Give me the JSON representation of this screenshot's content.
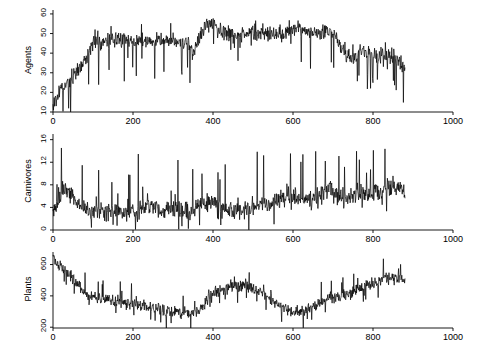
{
  "figure": {
    "background": "#ffffff",
    "foreground": "#000000",
    "panel_count": 3
  },
  "chart_data": [
    {
      "type": "line",
      "title": "",
      "xlabel": "",
      "ylabel": "Agents",
      "xlim": [
        0,
        1000
      ],
      "ylim": [
        10,
        62
      ],
      "xticks": [
        0,
        200,
        400,
        600,
        800,
        1000
      ],
      "yticks": [
        10,
        20,
        30,
        40,
        50,
        60
      ],
      "xtick_labels": [
        "0",
        "200",
        "400",
        "600",
        "800",
        "1000"
      ],
      "ytick_labels": [
        "10",
        "20",
        "30",
        "40",
        "50",
        "60"
      ],
      "grid": false,
      "legend": "none",
      "series": [
        {
          "name": "Agents",
          "x_start": 0,
          "x_end": 880,
          "n_points": 880,
          "seed": 17,
          "baseline_x": [
            0,
            20,
            45,
            70,
            100,
            140,
            180,
            210,
            230,
            250,
            265,
            280,
            300,
            320,
            340,
            350,
            360,
            375,
            390,
            410,
            430,
            450,
            470,
            490,
            510,
            530,
            550,
            570,
            590,
            610,
            630,
            650,
            670,
            690,
            700,
            715,
            730,
            750,
            770,
            790,
            810,
            830,
            850,
            865,
            880
          ],
          "baseline_y": [
            14,
            22,
            27,
            34,
            44,
            46,
            47,
            46,
            47,
            46,
            47,
            46,
            47,
            45,
            45,
            40,
            44,
            52,
            55,
            53,
            50,
            50,
            49,
            50,
            50,
            49,
            49,
            49,
            52,
            53,
            51,
            50,
            50,
            52,
            49,
            44,
            40,
            38,
            40,
            41,
            38,
            40,
            38,
            36,
            33
          ],
          "noise": 3.0,
          "spike_down": 11,
          "spike_up": 5
        }
      ]
    },
    {
      "type": "line",
      "title": "",
      "xlabel": "",
      "ylabel": "Carnivores",
      "xlim": [
        0,
        1000
      ],
      "ylim": [
        0,
        17
      ],
      "xticks": [
        0,
        200,
        400,
        600,
        800,
        1000
      ],
      "yticks": [
        0,
        4,
        8,
        12,
        16
      ],
      "xtick_labels": [
        "0",
        "200",
        "400",
        "600",
        "800",
        "1000"
      ],
      "ytick_labels": [
        "0",
        "4",
        "8",
        "12",
        "16"
      ],
      "grid": false,
      "legend": "none",
      "series": [
        {
          "name": "Carnivores",
          "x_start": 0,
          "x_end": 880,
          "n_points": 880,
          "seed": 83,
          "baseline_x": [
            0,
            10,
            25,
            40,
            60,
            80,
            100,
            130,
            160,
            190,
            210,
            230,
            250,
            270,
            290,
            310,
            330,
            350,
            370,
            390,
            410,
            430,
            450,
            470,
            490,
            510,
            530,
            550,
            570,
            590,
            610,
            630,
            650,
            670,
            690,
            710,
            730,
            750,
            770,
            790,
            810,
            830,
            850,
            865,
            880
          ],
          "baseline_y": [
            3.2,
            4.0,
            7.5,
            6.5,
            5.0,
            3.6,
            3.2,
            3.0,
            3.0,
            3.2,
            3.4,
            4.2,
            4.4,
            4.0,
            3.6,
            3.4,
            3.4,
            3.6,
            4.6,
            5.0,
            4.2,
            3.6,
            3.4,
            3.4,
            3.6,
            4.2,
            5.0,
            4.6,
            5.6,
            6.2,
            5.6,
            5.0,
            5.4,
            6.4,
            7.2,
            6.2,
            5.6,
            6.0,
            6.6,
            6.2,
            7.0,
            7.4,
            8.0,
            7.6,
            7.0
          ],
          "noise": 1.2,
          "spike_down": 1.6,
          "spike_up": 6.5
        }
      ]
    },
    {
      "type": "line",
      "title": "",
      "xlabel": "",
      "ylabel": "Plants",
      "xlim": [
        0,
        1000
      ],
      "ylim": [
        195,
        680
      ],
      "xticks": [
        0,
        200,
        400,
        600,
        800,
        1000
      ],
      "yticks": [
        200,
        400,
        600
      ],
      "xtick_labels": [
        "0",
        "200",
        "400",
        "600",
        "800",
        "1000"
      ],
      "ytick_labels": [
        "200",
        "400",
        "600"
      ],
      "grid": false,
      "legend": "none",
      "series": [
        {
          "name": "Plants",
          "x_start": 0,
          "x_end": 880,
          "n_points": 880,
          "seed": 41,
          "baseline_x": [
            0,
            15,
            30,
            50,
            70,
            90,
            110,
            140,
            170,
            200,
            225,
            250,
            275,
            300,
            320,
            340,
            360,
            375,
            390,
            405,
            420,
            440,
            460,
            480,
            500,
            520,
            540,
            560,
            580,
            600,
            615,
            630,
            650,
            670,
            690,
            710,
            730,
            750,
            770,
            790,
            810,
            830,
            850,
            865,
            880
          ],
          "baseline_y": [
            640,
            600,
            560,
            520,
            450,
            400,
            385,
            370,
            360,
            350,
            335,
            320,
            305,
            295,
            290,
            290,
            300,
            330,
            400,
            430,
            440,
            450,
            460,
            470,
            450,
            420,
            390,
            350,
            320,
            300,
            295,
            305,
            330,
            360,
            380,
            400,
            410,
            430,
            450,
            470,
            490,
            510,
            520,
            515,
            500
          ],
          "noise": 30,
          "spike_down": 55,
          "spike_up": 95
        }
      ]
    }
  ],
  "panels": [
    {
      "id": "agents",
      "ylabel": "Agents",
      "plot_left": 53,
      "plot_right": 453,
      "data_right": 405,
      "top": 10,
      "bottom": 112
    },
    {
      "id": "carnivores",
      "ylabel": "Carnivores",
      "plot_left": 53,
      "plot_right": 453,
      "data_right": 405,
      "top": 134,
      "bottom": 230
    },
    {
      "id": "plants",
      "ylabel": "Plants",
      "plot_left": 53,
      "plot_right": 453,
      "data_right": 405,
      "top": 252,
      "bottom": 328
    }
  ]
}
